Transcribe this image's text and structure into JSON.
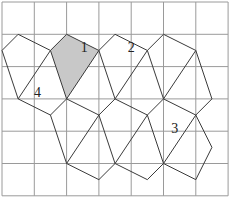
{
  "figure": {
    "type": "grid-tiling-diagram",
    "grid": {
      "cols": 7,
      "rows": 6,
      "origin_px": [
        2,
        2
      ],
      "cell_px": 32.3,
      "line_color": "#9a9a9a"
    },
    "shaded_color": "#c8c8c8",
    "edge_color": "#3a3a3a",
    "shaded_shape": {
      "label": "1",
      "points": [
        [
          2,
          1
        ],
        [
          3,
          1.5
        ],
        [
          2,
          3
        ],
        [
          1.5,
          1.5
        ]
      ]
    },
    "labels": [
      {
        "text": "1",
        "at": [
          2.55,
          1.45
        ]
      },
      {
        "text": "2",
        "at": [
          4.0,
          1.45
        ]
      },
      {
        "text": "3",
        "at": [
          5.35,
          3.95
        ]
      },
      {
        "text": "4",
        "at": [
          1.1,
          2.85
        ]
      }
    ],
    "segments": [
      [
        [
          0,
          1.5
        ],
        [
          0.5,
          1
        ]
      ],
      [
        [
          0.5,
          1
        ],
        [
          1.5,
          1.5
        ]
      ],
      [
        [
          1.5,
          1.5
        ],
        [
          2,
          1
        ]
      ],
      [
        [
          2,
          1
        ],
        [
          3,
          1.5
        ]
      ],
      [
        [
          3,
          1.5
        ],
        [
          3.5,
          1
        ]
      ],
      [
        [
          3.5,
          1
        ],
        [
          4.5,
          1.5
        ]
      ],
      [
        [
          4.5,
          1.5
        ],
        [
          5,
          1
        ]
      ],
      [
        [
          5,
          1
        ],
        [
          6,
          1.5
        ]
      ],
      [
        [
          0,
          1.5
        ],
        [
          0.5,
          3
        ]
      ],
      [
        [
          1.5,
          1.5
        ],
        [
          0.5,
          3
        ]
      ],
      [
        [
          1.5,
          1.5
        ],
        [
          2,
          3
        ]
      ],
      [
        [
          3,
          1.5
        ],
        [
          2,
          3
        ]
      ],
      [
        [
          3,
          1.5
        ],
        [
          3.5,
          3
        ]
      ],
      [
        [
          4.5,
          1.5
        ],
        [
          3.5,
          3
        ]
      ],
      [
        [
          4.5,
          1.5
        ],
        [
          5,
          3
        ]
      ],
      [
        [
          6,
          1.5
        ],
        [
          5,
          3
        ]
      ],
      [
        [
          6,
          1.5
        ],
        [
          6.5,
          3
        ]
      ],
      [
        [
          0.5,
          3
        ],
        [
          1.5,
          3.5
        ]
      ],
      [
        [
          1.5,
          3.5
        ],
        [
          2,
          3
        ]
      ],
      [
        [
          2,
          3
        ],
        [
          3,
          3.5
        ]
      ],
      [
        [
          3,
          3.5
        ],
        [
          3.5,
          3
        ]
      ],
      [
        [
          3.5,
          3
        ],
        [
          4.5,
          3.5
        ]
      ],
      [
        [
          4.5,
          3.5
        ],
        [
          5,
          3
        ]
      ],
      [
        [
          5,
          3
        ],
        [
          6,
          3.5
        ]
      ],
      [
        [
          6,
          3.5
        ],
        [
          6.5,
          3
        ]
      ],
      [
        [
          1.5,
          3.5
        ],
        [
          2,
          5
        ]
      ],
      [
        [
          3,
          3.5
        ],
        [
          2,
          5
        ]
      ],
      [
        [
          3,
          3.5
        ],
        [
          3.5,
          5
        ]
      ],
      [
        [
          4.5,
          3.5
        ],
        [
          3.5,
          5
        ]
      ],
      [
        [
          4.5,
          3.5
        ],
        [
          5,
          5
        ]
      ],
      [
        [
          6,
          3.5
        ],
        [
          5,
          5
        ]
      ],
      [
        [
          6,
          3.5
        ],
        [
          6.5,
          4.5
        ]
      ],
      [
        [
          2,
          5
        ],
        [
          3,
          5.5
        ]
      ],
      [
        [
          3,
          5.5
        ],
        [
          3.5,
          5
        ]
      ],
      [
        [
          3.5,
          5
        ],
        [
          4.5,
          5.5
        ]
      ],
      [
        [
          4.5,
          5.5
        ],
        [
          5,
          5
        ]
      ],
      [
        [
          5,
          5
        ],
        [
          6,
          5.5
        ]
      ],
      [
        [
          6,
          5.5
        ],
        [
          6.5,
          4.5
        ]
      ]
    ]
  }
}
